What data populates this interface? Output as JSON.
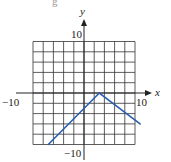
{
  "cropped_top_text": "g",
  "chart_data": {
    "type": "line",
    "title": "",
    "xlabel": "x",
    "ylabel": "y",
    "xlim": [
      -10,
      10
    ],
    "ylim": [
      -10,
      10
    ],
    "grid": true,
    "grid_step": 2,
    "tick_labels": {
      "x_left": "−10",
      "x_right": "10",
      "y_top": "10",
      "y_bottom": "−10"
    },
    "series": [
      {
        "name": "piecewise linear (inverted V)",
        "color": "#2b5fae",
        "points": [
          {
            "x": -7,
            "y": -10
          },
          {
            "x": 3,
            "y": 0
          },
          {
            "x": 11,
            "y": -6
          }
        ]
      }
    ],
    "annotations": []
  }
}
